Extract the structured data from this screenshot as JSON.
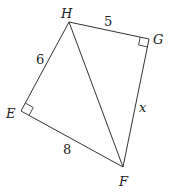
{
  "diagram": {
    "type": "quadrilateral-with-diagonal",
    "background": "#ffffff",
    "line_color": "#333333",
    "vertices": [
      {
        "name": "H",
        "label": "H",
        "x": 69,
        "y": 22
      },
      {
        "name": "G",
        "label": "G",
        "x": 149,
        "y": 39
      },
      {
        "name": "F",
        "label": "F",
        "x": 123,
        "y": 167
      },
      {
        "name": "E",
        "label": "E",
        "x": 21,
        "y": 111
      }
    ],
    "edges": [
      {
        "from": "H",
        "to": "G",
        "label": "5"
      },
      {
        "from": "G",
        "to": "F",
        "label": "x"
      },
      {
        "from": "F",
        "to": "E",
        "label": "8"
      },
      {
        "from": "E",
        "to": "H",
        "label": "6"
      },
      {
        "from": "H",
        "to": "F",
        "label": ""
      }
    ],
    "right_angles": [
      "G",
      "E"
    ],
    "labels": {
      "H": "H",
      "G": "G",
      "E": "E",
      "F": "F",
      "HG": "5",
      "EH": "6",
      "EF": "8",
      "GF": "x"
    }
  }
}
